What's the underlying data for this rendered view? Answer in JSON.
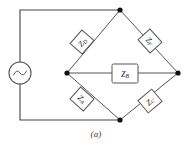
{
  "figure": {
    "caption": "(a)",
    "type": "ac-bridge-circuit-schematic"
  },
  "source": {
    "label": "ac-voltage-source",
    "symbol": "sine-wave"
  },
  "nodes": {
    "top": "top-node",
    "left": "left-node",
    "right": "right-node",
    "bottom": "bottom-node"
  },
  "components": [
    {
      "id": "zd",
      "letter": "Z",
      "subscript": "D",
      "position": "upper-left-arm"
    },
    {
      "id": "zf",
      "letter": "Z",
      "subscript": "F",
      "position": "upper-right-arm"
    },
    {
      "id": "za",
      "letter": "Z",
      "subscript": "A",
      "position": "lower-left-arm"
    },
    {
      "id": "zc",
      "letter": "Z",
      "subscript": "C",
      "position": "lower-right-arm"
    },
    {
      "id": "zb",
      "letter": "Z",
      "subscript": "B",
      "position": "center-bridge-arm"
    }
  ],
  "colors": {
    "wire": "#444444",
    "component_outline": "#555555",
    "node": "#111111",
    "background": "#ffffff",
    "text": "#1a1a1a"
  }
}
